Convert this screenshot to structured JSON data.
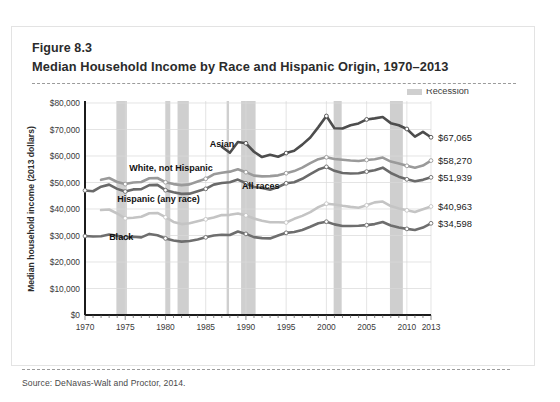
{
  "figure": {
    "number": "Figure 8.3",
    "title": "Median Household Income by Race and Hispanic Origin, 1970–2013",
    "source": "Source: DeNavas-Walt and Proctor, 2014."
  },
  "legend": {
    "recession_label": "Recession",
    "recession_color": "#cfcfcf"
  },
  "chart_data": {
    "type": "line",
    "title": "Median Household Income by Race and Hispanic Origin, 1970–2013",
    "xlabel": "",
    "ylabel": "Median household income (2013 dollars)",
    "xlim": [
      1970,
      2013
    ],
    "ylim": [
      0,
      80000
    ],
    "ytick_values": [
      0,
      10000,
      20000,
      30000,
      40000,
      50000,
      60000,
      70000,
      80000
    ],
    "ytick_labels": [
      "$0",
      "$10,000",
      "$20,000",
      "$30,000",
      "$40,000",
      "$50,000",
      "$60,000",
      "$70,000",
      "$80,000"
    ],
    "xtick_values": [
      1970,
      1975,
      1980,
      1985,
      1990,
      1995,
      2000,
      2005,
      2010,
      2013
    ],
    "xtick_labels": [
      "1970",
      "1975",
      "1980",
      "1985",
      "1990",
      "1995",
      "2000",
      "2005",
      "2010",
      "2013"
    ],
    "grid": true,
    "legend_position": "top-right",
    "recessions": [
      {
        "start": 1973.9,
        "end": 1975.2
      },
      {
        "start": 1980.0,
        "end": 1980.6
      },
      {
        "start": 1981.5,
        "end": 1982.9
      },
      {
        "start": 1987.6,
        "end": 1987.9
      },
      {
        "start": 1989.4,
        "end": 1991.2
      },
      {
        "start": 2000.9,
        "end": 2001.9
      },
      {
        "start": 2007.9,
        "end": 2009.5
      }
    ],
    "series": [
      {
        "name": "Asian",
        "color": "#4d4d4d",
        "end_value": 67065,
        "end_label": "$67,065",
        "label_x": 1985.5,
        "label_y": 63500,
        "x": [
          1987,
          1988,
          1989,
          1990,
          1991,
          1992,
          1993,
          1994,
          1995,
          1996,
          1997,
          1998,
          1999,
          2000,
          2001,
          2002,
          2003,
          2004,
          2005,
          2006,
          2007,
          2008,
          2009,
          2010,
          2011,
          2012,
          2013
        ],
        "y": [
          63500,
          61200,
          65300,
          64800,
          61600,
          59600,
          60500,
          59700,
          61100,
          62000,
          64300,
          67000,
          70900,
          75100,
          70500,
          70400,
          71600,
          72300,
          73800,
          74200,
          74700,
          72400,
          71600,
          70200,
          67300,
          69100,
          67065
        ]
      },
      {
        "name": "White, not Hispanic",
        "color": "#9a9a9a",
        "end_value": 58270,
        "end_label": "$58,270",
        "label_x": 1975.5,
        "label_y": 54500,
        "x": [
          1972,
          1973,
          1974,
          1975,
          1976,
          1977,
          1978,
          1979,
          1980,
          1981,
          1982,
          1983,
          1984,
          1985,
          1986,
          1987,
          1988,
          1989,
          1990,
          1991,
          1992,
          1993,
          1994,
          1995,
          1996,
          1997,
          1998,
          1999,
          2000,
          2001,
          2002,
          2003,
          2004,
          2005,
          2006,
          2007,
          2008,
          2009,
          2010,
          2011,
          2012,
          2013
        ],
        "y": [
          51000,
          51700,
          50200,
          49400,
          50000,
          50200,
          51600,
          51700,
          50100,
          49400,
          49000,
          49300,
          50400,
          51400,
          53100,
          53700,
          54100,
          55000,
          53900,
          52600,
          52300,
          52400,
          52700,
          53500,
          54300,
          55600,
          57300,
          58800,
          59500,
          58900,
          58600,
          58300,
          58100,
          58500,
          58800,
          59400,
          57900,
          57200,
          56300,
          55600,
          56400,
          58270
        ]
      },
      {
        "name": "All races",
        "color": "#6a6a6a",
        "end_value": 51939,
        "end_label": "$51,939",
        "label_x": 1989.5,
        "label_y": 47500,
        "x": [
          1970,
          1971,
          1972,
          1973,
          1974,
          1975,
          1976,
          1977,
          1978,
          1979,
          1980,
          1981,
          1982,
          1983,
          1984,
          1985,
          1986,
          1987,
          1988,
          1989,
          1990,
          1991,
          1992,
          1993,
          1994,
          1995,
          1996,
          1997,
          1998,
          1999,
          2000,
          2001,
          2002,
          2003,
          2004,
          2005,
          2006,
          2007,
          2008,
          2009,
          2010,
          2011,
          2012,
          2013
        ],
        "y": [
          47000,
          46700,
          48400,
          49200,
          47600,
          46600,
          47400,
          47500,
          49000,
          49100,
          47100,
          46300,
          45700,
          45800,
          46700,
          47600,
          49200,
          49800,
          50100,
          51100,
          49700,
          48300,
          47900,
          47300,
          48300,
          49700,
          50100,
          51400,
          53200,
          54900,
          55900,
          54400,
          53600,
          53400,
          53500,
          54100,
          54600,
          55600,
          53600,
          52200,
          51200,
          50500,
          51000,
          51939
        ]
      },
      {
        "name": "Hispanic (any race)",
        "color": "#c4c4c4",
        "end_value": 40963,
        "end_label": "$40,963",
        "label_x": 1974.0,
        "label_y": 42600,
        "x": [
          1972,
          1973,
          1974,
          1975,
          1976,
          1977,
          1978,
          1979,
          1980,
          1981,
          1982,
          1983,
          1984,
          1985,
          1986,
          1987,
          1988,
          1989,
          1990,
          1991,
          1992,
          1993,
          1994,
          1995,
          1996,
          1997,
          1998,
          1999,
          2000,
          2001,
          2002,
          2003,
          2004,
          2005,
          2006,
          2007,
          2008,
          2009,
          2010,
          2011,
          2012,
          2013
        ],
        "y": [
          39600,
          39800,
          38300,
          36500,
          36700,
          37100,
          38400,
          38500,
          36900,
          35100,
          34300,
          34600,
          35400,
          36100,
          36800,
          37700,
          37800,
          38300,
          37600,
          36400,
          35600,
          35000,
          35000,
          34900,
          36300,
          37400,
          38800,
          40700,
          42000,
          41700,
          41200,
          40800,
          40500,
          41400,
          42500,
          42800,
          41100,
          40200,
          39500,
          38900,
          39900,
          40963
        ]
      },
      {
        "name": "Black",
        "color": "#6e6e6e",
        "end_value": 34598,
        "end_label": "$34,598",
        "label_x": 1973.0,
        "label_y": 28200,
        "x": [
          1970,
          1971,
          1972,
          1973,
          1974,
          1975,
          1976,
          1977,
          1978,
          1979,
          1980,
          1981,
          1982,
          1983,
          1984,
          1985,
          1986,
          1987,
          1988,
          1989,
          1990,
          1991,
          1992,
          1993,
          1994,
          1995,
          1996,
          1997,
          1998,
          1999,
          2000,
          2001,
          2002,
          2003,
          2004,
          2005,
          2006,
          2007,
          2008,
          2009,
          2010,
          2011,
          2012,
          2013
        ],
        "y": [
          29800,
          29600,
          29700,
          30400,
          29900,
          29100,
          29500,
          29300,
          30600,
          30100,
          28900,
          28100,
          27700,
          27900,
          28500,
          29300,
          30000,
          30300,
          30200,
          31500,
          30600,
          29400,
          29000,
          28900,
          30000,
          31000,
          31300,
          32100,
          33300,
          34600,
          35200,
          34200,
          33600,
          33600,
          33700,
          33900,
          34300,
          35100,
          33800,
          33000,
          32500,
          32100,
          33000,
          34598
        ]
      }
    ]
  }
}
